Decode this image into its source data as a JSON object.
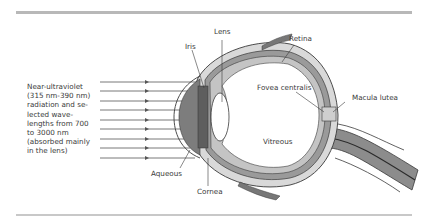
{
  "figure": {
    "caption_lines": [
      "Near-ultraviolet",
      "(315 nm-390 nm)",
      "radiation and se-",
      "lected wave-",
      "lengths from 700",
      "to 3000 nm",
      "(absorbed mainly",
      "in the lens)"
    ],
    "labels": {
      "lens": "Lens",
      "iris": "Iris",
      "retina": "Retina",
      "fovea_centralis": "Fovea centralis",
      "macula_lutea": "Macula lutea",
      "vitreous": "Vitreous",
      "aqueous": "Aqueous",
      "cornea": "Cornea"
    },
    "ray_count": 9,
    "colors": {
      "rule": "#b8b8b8",
      "outline": "#3a3a3a",
      "sclera_fill": "#d9d9d9",
      "choroid_fill": "#9a9a9a",
      "iris_fill": "#6e6e6e",
      "lens_fill": "#ffffff",
      "nerve_fill": "#8c8c8c",
      "macula_fill": "#cfcfcf"
    }
  }
}
